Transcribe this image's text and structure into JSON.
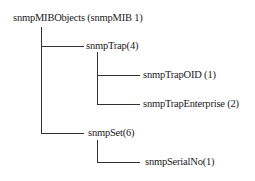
{
  "tree": {
    "root": {
      "label": "snmpMIBObjects (snmpMIB 1)"
    },
    "nodes": [
      {
        "label": "snmpTrap(4)",
        "parent": "root",
        "children": [
          {
            "label": "snmpTrapOID (1)"
          },
          {
            "label": "snmpTrapEnterprise (2)"
          }
        ]
      },
      {
        "label": "snmpSet(6)",
        "parent": "root",
        "children": [
          {
            "label": "snmpSerialNo(1)"
          }
        ]
      }
    ]
  }
}
